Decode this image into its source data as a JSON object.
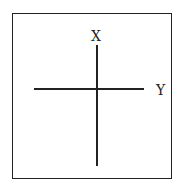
{
  "diagram": {
    "type": "axes-cross",
    "labels": {
      "vertical_axis": "X",
      "horizontal_axis": "Y"
    },
    "colors": {
      "stroke": "#222222",
      "background": "#ffffff"
    }
  }
}
